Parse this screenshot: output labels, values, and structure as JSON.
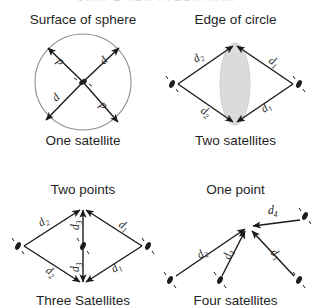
{
  "header": {
    "title": "SPACE TRILATERATION"
  },
  "diagram": {
    "type": "trilateration-concept-grid",
    "panels": [
      {
        "id": "one-satellite",
        "title": "Surface of sphere",
        "caption": "One satellite",
        "shape": "circle-with-four-radial-arrows",
        "satellite_count": 1,
        "distance_labels": [
          "d",
          "d",
          "d",
          "d"
        ]
      },
      {
        "id": "two-satellites",
        "title": "Edge of circle",
        "caption": "Two satellites",
        "shape": "rhombus-with-lens-intersection",
        "satellite_count": 2,
        "distance_labels": [
          "d₂",
          "d₁",
          "d₂",
          "d₁"
        ]
      },
      {
        "id": "three-satellites",
        "title": "Two points",
        "caption": "Three Satellites",
        "shape": "rhombus-with-vertical-median",
        "satellite_count": 3,
        "distance_labels": [
          "d₂",
          "d₃",
          "d₁",
          "d₂",
          "d₃",
          "d₁"
        ]
      },
      {
        "id": "four-satellites",
        "title": "One point",
        "caption": "Four satellites",
        "shape": "four-arrows-converging-on-point",
        "satellite_count": 4,
        "distance_labels": [
          "d₄",
          "d₂",
          "d₃",
          "d₁"
        ]
      }
    ],
    "label_parts": {
      "d": "d",
      "sub1": "1",
      "sub2": "2",
      "sub3": "3",
      "sub4": "4"
    }
  },
  "colors": {
    "ink": "#1a1a1a",
    "circle_outline": "#8d8d8d",
    "lens_fill": "#dadada",
    "background": "#ffffff",
    "faded_title": "#b9b9c2"
  }
}
